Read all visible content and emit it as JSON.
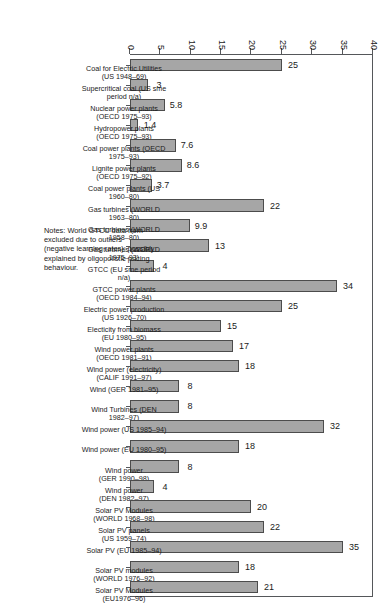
{
  "chart_data": {
    "type": "bar",
    "orientation": "horizontal",
    "title": "",
    "xlabel": "",
    "ylabel": "",
    "ylim": [
      0,
      40
    ],
    "grid": false,
    "legend": null,
    "ticks": [
      "0",
      "5",
      "10",
      "15",
      "20",
      "25",
      "30",
      "35",
      "40"
    ],
    "tick_values": [
      0,
      5,
      10,
      15,
      20,
      25,
      30,
      35,
      40
    ],
    "categories": [
      "Coal for Electric Utilities\n(US 1948–69)",
      "Supercritical coal (US sme\nperiod n/a)",
      "Nuclear power plants\n(OECD 1975–93)",
      "Hydropower plants\n(OECD 1975–93)",
      "Coal power plants (OECD\n1975–93)",
      "Lignite power plants\n(OECD 1975–92)",
      "Coal power plants (US\n1960–80)",
      "Gas turbines (WORLD\n1963–80)",
      "Gas turbines (WORLD\n1958–80)",
      "Gas turbines (WORLD\n1975–93)",
      "GTCC (EU sme period\nn/a)",
      "GTCC power plants\n(OECD 1984–94)",
      "Electric power production\n(US 1926–70)",
      "Electicity from biomass\n(EU 1980–95)",
      "Wind power plants\n(OECD 1981–91)",
      "Wind power (electricity)\n(CALIF 1991–97)",
      "Wind (GER 1981–95)",
      "Wind Turbines (DEN\n1982–97)",
      "Wind power (US 1985–94)",
      "Wind power (EU 1980–95)",
      "Wind power\n(GER 1990–98)",
      "Wind power\n(DEN 1982–97)",
      "Solar PV Modules\n(WORLD 1968–98)",
      "Solar PV panels\n(US 1959–74)",
      "Solar PV (EU 1985–94)",
      "Solar PV modules\n(WORLD 1976–92)",
      "Solar PV Modules\n(EU1976–96)"
    ],
    "values": [
      25,
      3,
      5.8,
      1.4,
      7.6,
      8.6,
      3.7,
      22,
      9.9,
      13,
      4,
      34,
      25,
      15,
      17,
      18,
      8,
      8,
      32,
      18,
      8,
      4,
      20,
      22,
      35,
      18,
      21
    ],
    "value_labels": [
      "25",
      "3",
      "5.8",
      "1.4",
      "7.6",
      "8.6",
      "3.7",
      "22",
      "9.9",
      "13",
      "4",
      "34",
      "25",
      "15",
      "17",
      "18",
      "8",
      "8",
      "32",
      "18",
      "8",
      "4",
      "20",
      "22",
      "35",
      "18",
      "21"
    ],
    "bar_color": "#a6a6a6",
    "bar_edge_color": "#4c4c4c",
    "notes": "Notes: World GTCC data from\nexcluded due to outliers\n(negative learning rates); possibly\nexplained by oligopolistic pricing\nbehaviour."
  }
}
